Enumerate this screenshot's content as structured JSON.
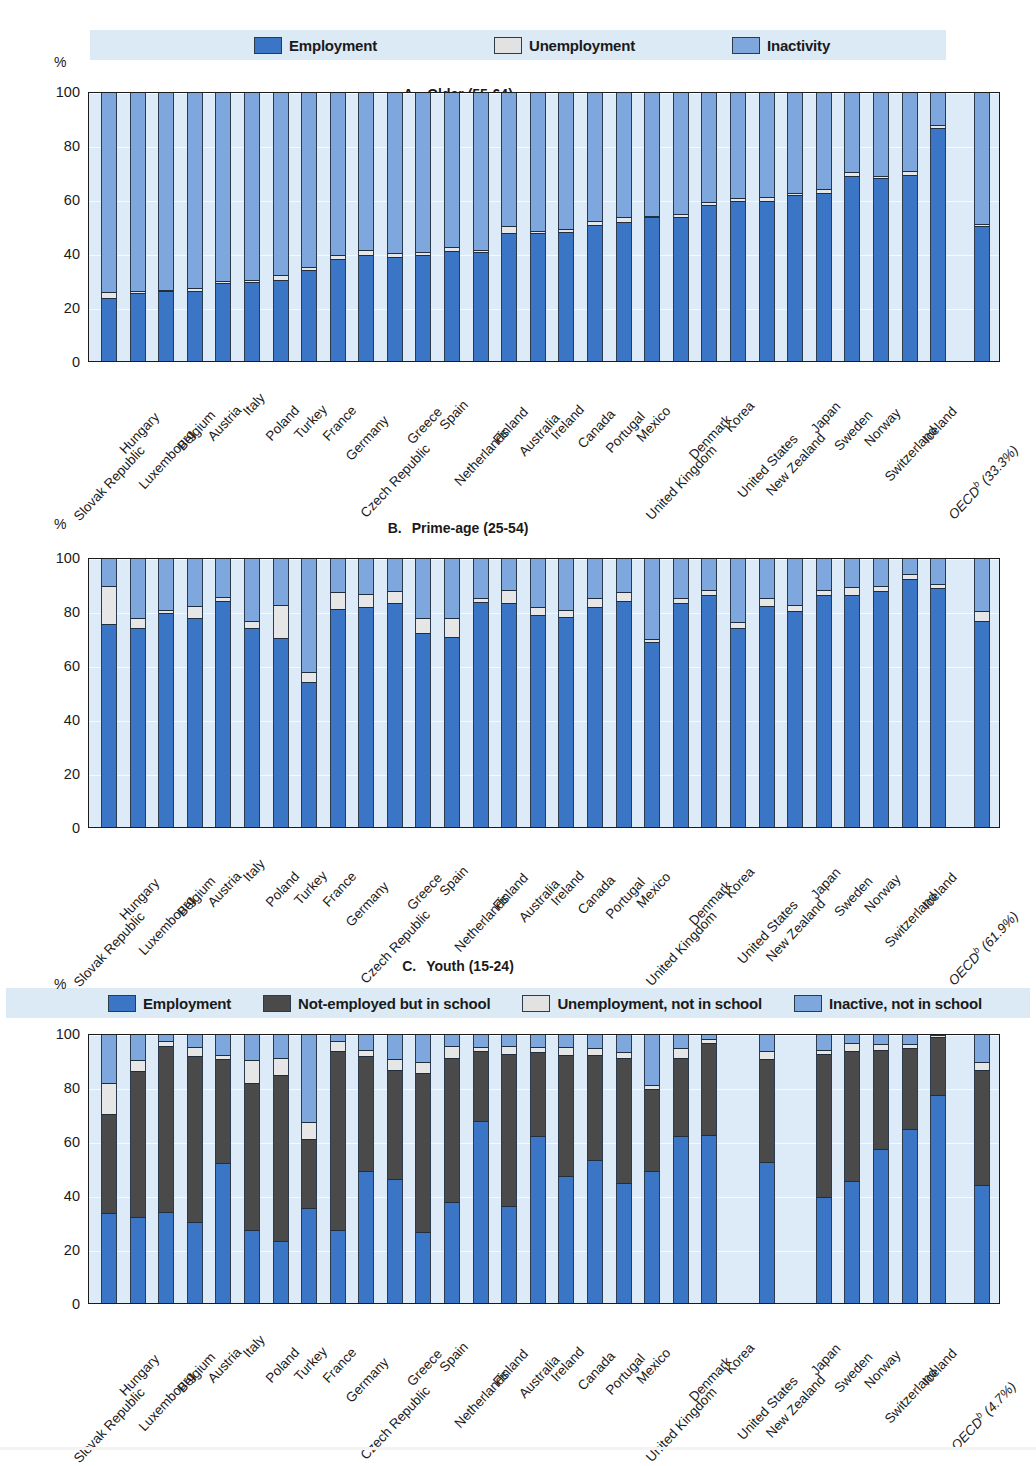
{
  "figure": {
    "countries": [
      "Slovak Republic",
      "Hungary",
      "Luxembourg",
      "Belgium",
      "Austria",
      "Italy",
      "Poland",
      "Turkey",
      "France",
      "Germany",
      "Czech Republic",
      "Greece",
      "Spain",
      "Netherlands",
      "Finland",
      "Australia",
      "Ireland",
      "Canada",
      "Portugal",
      "Mexico",
      "United Kingdom",
      "Denmark",
      "Korea",
      "United States",
      "New Zealand",
      "Japan",
      "Sweden",
      "Norway",
      "Switzerland",
      "Iceland"
    ],
    "y_axis_label": "%",
    "y_ticks": [
      0,
      20,
      40,
      60,
      80,
      100
    ],
    "legend_top": [
      {
        "label": "Employment",
        "key": "employment",
        "color": "#3b76c6"
      },
      {
        "label": "Unemployment",
        "key": "unemployment",
        "color": "#e2e2e2"
      },
      {
        "label": "Inactivity",
        "key": "inactivity",
        "color": "#7ea7dd"
      }
    ],
    "legend_youth": [
      {
        "label": "Employment",
        "key": "employment",
        "color": "#3b76c6"
      },
      {
        "label": "Not-employed but in school",
        "key": "in_school",
        "color": "#4a4a4a"
      },
      {
        "label": "Unemployment, not in school",
        "key": "unemployment",
        "color": "#e6e6e6"
      },
      {
        "label": "Inactive, not in school",
        "key": "inactivity",
        "color": "#7ea7dd"
      }
    ]
  },
  "chart_data": [
    {
      "type": "bar",
      "panel": "A",
      "title": "Older (55-64)",
      "title_letter": "A.",
      "xlabel": "",
      "ylabel": "%",
      "ylim": [
        0,
        100
      ],
      "grid": true,
      "stacked": true,
      "legend_position": "top",
      "categories": [
        "Slovak Republic",
        "Hungary",
        "Luxembourg",
        "Belgium",
        "Austria",
        "Italy",
        "Poland",
        "Turkey",
        "France",
        "Germany",
        "Czech Republic",
        "Greece",
        "Spain",
        "Netherlands",
        "Finland",
        "Australia",
        "Ireland",
        "Canada",
        "Portugal",
        "Mexico",
        "United Kingdom",
        "Denmark",
        "Korea",
        "United States",
        "New Zealand",
        "Japan",
        "Sweden",
        "Norway",
        "Switzerland",
        "Iceland"
      ],
      "aggregate": {
        "label": "OECD",
        "superscript": "b",
        "value_label": "(33.3%)",
        "employment": 49.5,
        "unemployment": 1.0,
        "inactivity": 49.5
      },
      "tick_labels": [
        "Slovak Republic",
        "Hungary",
        "Luxembourg",
        "Belgium",
        "Austria",
        "Italy",
        "Poland",
        "Turkey",
        "France",
        "Germany",
        "Czech Republic",
        "Greece",
        "Spain",
        "Netherlands",
        "Finland",
        "Australia",
        "Ireland",
        "Canada",
        "Portugal",
        "Mexico",
        "United Kingdom",
        "Denmark",
        "Korea",
        "United States",
        "New Zealand",
        "Japan",
        "Sweden",
        "Norway",
        "Switzerland",
        "Iceland",
        "OECD (33.3%)"
      ],
      "series": [
        {
          "name": "Employment",
          "values": [
            23.0,
            24.8,
            25.5,
            25.5,
            28.5,
            29.0,
            29.5,
            33.5,
            37.5,
            38.8,
            38.2,
            39.0,
            40.5,
            40.0,
            47.0,
            47.0,
            47.5,
            50.0,
            51.0,
            52.8,
            53.0,
            57.5,
            59.0,
            59.0,
            61.0,
            62.0,
            68.0,
            67.5,
            68.5,
            86.0
          ]
        },
        {
          "name": "Unemployment",
          "values": [
            2.2,
            0.9,
            0.4,
            1.1,
            0.8,
            0.6,
            2.0,
            0.8,
            1.4,
            2.0,
            1.6,
            1.0,
            1.5,
            0.8,
            2.5,
            0.9,
            1.0,
            1.6,
            2.0,
            0.5,
            1.2,
            1.2,
            0.9,
            1.5,
            0.7,
            1.3,
            1.6,
            0.6,
            1.5,
            1.0
          ]
        },
        {
          "name": "Inactivity",
          "values": [
            74.8,
            74.3,
            74.1,
            73.4,
            70.7,
            70.4,
            68.5,
            65.7,
            61.1,
            59.2,
            60.2,
            60.0,
            58.0,
            59.2,
            50.5,
            52.1,
            51.5,
            48.4,
            47.0,
            46.7,
            45.8,
            41.3,
            40.1,
            39.5,
            38.3,
            36.7,
            30.4,
            31.9,
            30.0,
            13.0
          ]
        }
      ]
    },
    {
      "type": "bar",
      "panel": "B",
      "title": "Prime-age (25-54)",
      "title_letter": "B.",
      "xlabel": "",
      "ylabel": "%",
      "ylim": [
        0,
        100
      ],
      "grid": true,
      "stacked": true,
      "legend_position": "top-shared",
      "categories": [
        "Slovak Republic",
        "Hungary",
        "Luxembourg",
        "Belgium",
        "Austria",
        "Italy",
        "Poland",
        "Turkey",
        "France",
        "Germany",
        "Czech Republic",
        "Greece",
        "Spain",
        "Netherlands",
        "Finland",
        "Australia",
        "Ireland",
        "Canada",
        "Portugal",
        "Mexico",
        "United Kingdom",
        "Denmark",
        "Korea",
        "United States",
        "New Zealand",
        "Japan",
        "Sweden",
        "Norway",
        "Switzerland",
        "Iceland"
      ],
      "aggregate": {
        "label": "OECD",
        "superscript": "b",
        "value_label": "(61.9%)",
        "employment": 76.0,
        "unemployment": 3.5,
        "inactivity": 20.5
      },
      "tick_labels": [
        "Slovak Republic",
        "Hungary",
        "Luxembourg",
        "Belgium",
        "Austria",
        "Italy",
        "Poland",
        "Turkey",
        "France",
        "Germany",
        "Czech Republic",
        "Greece",
        "Spain",
        "Netherlands",
        "Finland",
        "Australia",
        "Ireland",
        "Canada",
        "Portugal",
        "Mexico",
        "United Kingdom",
        "Denmark",
        "Korea",
        "United States",
        "New Zealand",
        "Japan",
        "Sweden",
        "Norway",
        "Switzerland",
        "Iceland",
        "OECD (61.9%)"
      ],
      "series": [
        {
          "name": "Employment",
          "values": [
            75.0,
            73.5,
            79.0,
            77.0,
            83.5,
            73.5,
            69.5,
            53.5,
            80.5,
            81.0,
            82.5,
            71.5,
            70.0,
            83.0,
            82.5,
            78.0,
            77.5,
            81.0,
            83.5,
            68.0,
            82.5,
            85.5,
            73.5,
            81.5,
            79.5,
            85.5,
            85.5,
            87.0,
            91.5,
            88.0
          ]
        },
        {
          "name": "Unemployment",
          "values": [
            14.0,
            3.5,
            1.0,
            4.5,
            1.5,
            2.5,
            12.5,
            3.5,
            6.0,
            5.0,
            4.5,
            5.5,
            7.0,
            1.5,
            5.0,
            3.0,
            2.5,
            3.5,
            3.0,
            1.2,
            2.0,
            2.0,
            2.0,
            3.0,
            2.5,
            2.0,
            3.0,
            2.0,
            2.0,
            1.5
          ]
        },
        {
          "name": "Inactivity",
          "values": [
            11.0,
            23.0,
            20.0,
            18.5,
            15.0,
            24.0,
            18.0,
            43.0,
            13.5,
            14.0,
            13.0,
            23.0,
            23.0,
            15.5,
            12.5,
            19.0,
            20.0,
            15.5,
            13.5,
            30.8,
            15.5,
            12.5,
            24.5,
            15.5,
            18.0,
            12.5,
            11.5,
            11.0,
            6.5,
            10.5
          ]
        }
      ]
    },
    {
      "type": "bar",
      "panel": "C",
      "title": "Youth (15-24)",
      "title_letter": "C.",
      "xlabel": "",
      "ylabel": "%",
      "ylim": [
        0,
        100
      ],
      "grid": true,
      "stacked": true,
      "legend_position": "top",
      "categories": [
        "Slovak Republic",
        "Hungary",
        "Luxembourg",
        "Belgium",
        "Austria",
        "Italy",
        "Poland",
        "Turkey",
        "France",
        "Germany",
        "Czech Republic",
        "Greece",
        "Spain",
        "Netherlands",
        "Finland",
        "Australia",
        "Ireland",
        "Canada",
        "Portugal",
        "Mexico",
        "United Kingdom",
        "Denmark",
        "Korea",
        "United States",
        "New Zealand",
        "Japan",
        "Sweden",
        "Norway",
        "Switzerland",
        "Iceland"
      ],
      "aggregate": {
        "label": "OECD",
        "superscript": "b",
        "value_label": "(4.7%)",
        "employment": 43.5,
        "in_school": 42.5,
        "unemployment": 3.0,
        "inactivity": 11.0
      },
      "missing": [
        "Korea",
        "New Zealand"
      ],
      "tick_labels": [
        "Slovak Republic",
        "Hungary",
        "Luxembourg",
        "Belgium",
        "Austria",
        "Italy",
        "Poland",
        "Turkey",
        "France",
        "Germany",
        "Czech Republic",
        "Greece",
        "Spain",
        "Netherlands",
        "Finland",
        "Australia",
        "Ireland",
        "Canada",
        "Portugal",
        "Mexico",
        "United Kingdom",
        "Denmark",
        "Korea",
        "United States",
        "New Zealand",
        "Japan",
        "Sweden",
        "Norway",
        "Switzerland",
        "Iceland",
        "OECD (4.7%)"
      ],
      "series": [
        {
          "name": "Employment",
          "values": [
            33.0,
            31.5,
            33.5,
            29.5,
            51.5,
            26.5,
            22.5,
            35.0,
            26.5,
            48.5,
            45.5,
            26.0,
            37.0,
            67.0,
            35.5,
            61.5,
            46.5,
            52.5,
            44.0,
            48.5,
            61.5,
            62.0,
            null,
            52.0,
            null,
            39.0,
            45.0,
            56.5,
            64.0,
            76.5
          ]
        },
        {
          "name": "Not-employed but in school",
          "values": [
            36.5,
            54.0,
            61.5,
            61.5,
            38.5,
            54.5,
            61.5,
            25.5,
            66.5,
            42.5,
            40.5,
            59.0,
            53.5,
            26.0,
            56.5,
            31.0,
            45.0,
            39.0,
            46.5,
            30.5,
            29.0,
            34.0,
            null,
            38.0,
            null,
            53.0,
            48.0,
            37.0,
            30.0,
            21.5
          ]
        },
        {
          "name": "Unemployment, not in school",
          "values": [
            11.5,
            4.0,
            1.5,
            3.5,
            1.5,
            8.5,
            6.5,
            6.0,
            3.5,
            2.5,
            4.0,
            4.0,
            4.5,
            1.5,
            3.0,
            2.0,
            3.0,
            2.5,
            2.0,
            1.5,
            3.5,
            1.5,
            null,
            3.0,
            null,
            1.5,
            3.0,
            2.0,
            1.5,
            1.0
          ]
        },
        {
          "name": "Inactive, not in school",
          "values": [
            19.0,
            10.5,
            3.5,
            5.5,
            8.5,
            10.5,
            9.5,
            33.5,
            3.5,
            6.5,
            10.0,
            11.0,
            5.0,
            5.5,
            5.0,
            5.5,
            5.5,
            6.0,
            7.5,
            19.5,
            6.0,
            2.5,
            null,
            7.0,
            null,
            6.5,
            4.0,
            4.5,
            4.5,
            1.0
          ]
        }
      ]
    }
  ]
}
